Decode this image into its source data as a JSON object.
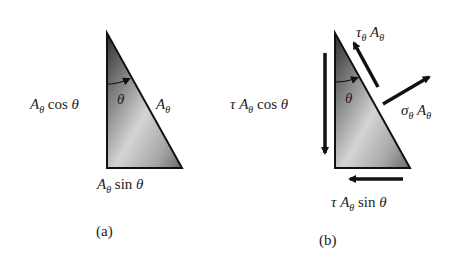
{
  "figure_a": {
    "caption": "(a)",
    "labels": {
      "vertical_side": {
        "base": "A",
        "sub": "θ",
        "rest": " cos ",
        "angle": "θ"
      },
      "hypotenuse": {
        "base": "A",
        "sub": "θ"
      },
      "horizontal_side": {
        "base": "A",
        "sub": "θ",
        "rest": " sin ",
        "angle": "θ"
      },
      "angle": "θ"
    }
  },
  "figure_b": {
    "caption": "(b)",
    "labels": {
      "left_force": {
        "pre": "τ ",
        "base": "A",
        "sub": "θ",
        "rest": " cos ",
        "angle": "θ"
      },
      "shear_force": {
        "pre": "τ",
        "pre_sub": "θ",
        "base": " A",
        "sub": "θ"
      },
      "normal_force": {
        "pre": "σ",
        "pre_sub": "θ",
        "base": " A",
        "sub": "θ"
      },
      "bottom_force": {
        "pre": "τ ",
        "base": "A",
        "sub": "θ",
        "rest": " sin ",
        "angle": "θ"
      },
      "angle": "θ"
    }
  },
  "colors": {
    "triangle_dark": "#3a3a3a",
    "triangle_light": "#d8d8d8",
    "stroke": "#111111"
  }
}
